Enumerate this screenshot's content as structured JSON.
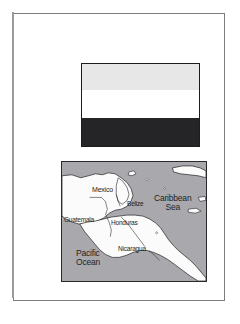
{
  "document": {
    "type": "flag-and-map-plate",
    "background_color": "#ffffff",
    "frame_color": "#7b7b80"
  },
  "flag": {
    "name": "flag-of-honduras",
    "aspect": "119x84",
    "border_color": "#1c1c1c",
    "bands": [
      {
        "name": "top-band",
        "color": "#e7e7e7",
        "label": "light gray band"
      },
      {
        "name": "middle-band",
        "color": "#ffffff",
        "label": "white band"
      },
      {
        "name": "bottom-band",
        "color": "#252527",
        "label": "black band"
      }
    ]
  },
  "map": {
    "name": "central-america-map",
    "border_color": "#2a2a2c",
    "water_color": "#a9a9ad",
    "land_color": "#fbfbfb",
    "coast_color": "#1f1f22",
    "labels": {
      "mexico": "Mexico",
      "belize": "Belize",
      "guatemala": "Guatemala",
      "honduras": "Honduras",
      "nicaragua": "Nicaragua",
      "caribbean_sea_line1": "Caribbean",
      "caribbean_sea_line2": "Sea",
      "pacific_ocean_line1": "Pacific",
      "pacific_ocean_line2": "Ocean"
    }
  }
}
